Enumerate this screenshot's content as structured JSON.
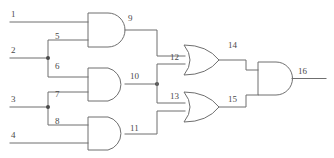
{
  "diagram": {
    "type": "logic-gate-schematic",
    "canvas": {
      "width": 334,
      "height": 158
    },
    "style": {
      "wire_color": "#6f6f6f",
      "label_color": "#4a4a4a",
      "background": "#ffffff",
      "stroke_width": 1
    },
    "inputs": [
      {
        "id": "1",
        "label": "1",
        "y": 22
      },
      {
        "id": "2",
        "label": "2",
        "y": 58
      },
      {
        "id": "3",
        "label": "3",
        "y": 107
      },
      {
        "id": "4",
        "label": "4",
        "y": 143
      }
    ],
    "gates": [
      {
        "id": "g9",
        "type": "AND",
        "output_label": "9",
        "inputs": [
          "1",
          "5"
        ]
      },
      {
        "id": "g10",
        "type": "AND",
        "output_label": "10",
        "inputs": [
          "6",
          "7"
        ]
      },
      {
        "id": "g11",
        "type": "AND",
        "output_label": "11",
        "inputs": [
          "8",
          "4"
        ]
      },
      {
        "id": "g14",
        "type": "OR",
        "output_label": "14",
        "inputs": [
          "9",
          "12"
        ]
      },
      {
        "id": "g15",
        "type": "OR",
        "output_label": "15",
        "inputs": [
          "13",
          "11"
        ]
      },
      {
        "id": "g16",
        "type": "AND",
        "output_label": "16",
        "inputs": [
          "14",
          "15"
        ]
      }
    ],
    "junctions": [
      {
        "id": "j2",
        "net": "2",
        "x": 48,
        "y": 58,
        "fans_to": [
          "5",
          "6"
        ]
      },
      {
        "id": "j3",
        "net": "3",
        "x": 48,
        "y": 107,
        "fans_to": [
          "7",
          "8"
        ]
      },
      {
        "id": "j10",
        "net": "10",
        "x": 157,
        "y": 84,
        "fans_to": [
          "12",
          "13"
        ]
      }
    ],
    "nets": [
      {
        "label": "1",
        "x": 11,
        "y": 10
      },
      {
        "label": "2",
        "x": 11,
        "y": 46
      },
      {
        "label": "3",
        "x": 11,
        "y": 95
      },
      {
        "label": "4",
        "x": 11,
        "y": 131
      },
      {
        "label": "5",
        "x": 55,
        "y": 32
      },
      {
        "label": "6",
        "x": 55,
        "y": 62
      },
      {
        "label": "7",
        "x": 55,
        "y": 90
      },
      {
        "label": "8",
        "x": 55,
        "y": 117
      },
      {
        "label": "9",
        "x": 128,
        "y": 14
      },
      {
        "label": "10",
        "x": 130,
        "y": 72
      },
      {
        "label": "11",
        "x": 130,
        "y": 124
      },
      {
        "label": "12",
        "x": 170,
        "y": 53
      },
      {
        "label": "13",
        "x": 170,
        "y": 92
      },
      {
        "label": "14",
        "x": 228,
        "y": 41
      },
      {
        "label": "15",
        "x": 228,
        "y": 95
      },
      {
        "label": "16",
        "x": 298,
        "y": 67
      }
    ]
  }
}
